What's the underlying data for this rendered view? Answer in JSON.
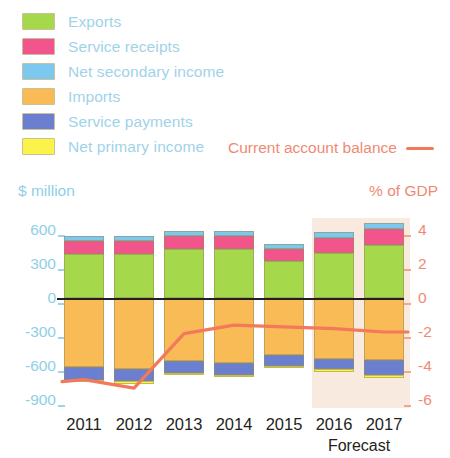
{
  "legend": {
    "items": [
      {
        "label": "Exports",
        "color": "#a5d94b",
        "key": "exports"
      },
      {
        "label": "Service receipts",
        "color": "#f2558c",
        "key": "service_receipts"
      },
      {
        "label": "Net secondary income",
        "color": "#7cc8ee",
        "key": "net_secondary_income"
      },
      {
        "label": "Imports",
        "color": "#f8b council",
        "key": "imports"
      },
      {
        "label": "Service payments",
        "color": "#6b7fd0",
        "key": "service_payments"
      },
      {
        "label": "Net primary income",
        "color": "#fbf24a",
        "key": "net_primary_income"
      }
    ],
    "line_series_label": "Current account balance",
    "line_color": "#f2795a"
  },
  "axes": {
    "left_title": "$ million",
    "right_title": "% of GDP",
    "left_ticks": [
      "600",
      "300",
      "0",
      "-300",
      "-600",
      "-900"
    ],
    "left_tick_values": [
      600,
      300,
      0,
      -300,
      -600,
      -900
    ],
    "right_ticks": [
      "4",
      "2",
      "0",
      "-2",
      "-4",
      "-6"
    ],
    "right_tick_values": [
      4,
      2,
      0,
      -2,
      -4,
      -6
    ],
    "left_color": "#8fcfe6",
    "right_color": "#f08a74"
  },
  "forecast": {
    "note": "Forecast",
    "years": [
      "2016",
      "2017"
    ],
    "band_color": "#f6ddcb"
  },
  "chart_data": {
    "type": "bar",
    "title": "",
    "subtitle": "",
    "xlabel": "",
    "ylabel": "$ million",
    "y2label": "% of GDP",
    "ylim": [
      -900,
      600
    ],
    "y2lim": [
      -6,
      4
    ],
    "grid": false,
    "legend_position": "top-left",
    "stacked": true,
    "categories": [
      "2011",
      "2012",
      "2013",
      "2014",
      "2015",
      "2016",
      "2017"
    ],
    "series": [
      {
        "name": "Exports",
        "color": "#a5d94b",
        "sign": "positive",
        "values": [
          390,
          390,
          430,
          430,
          330,
          400,
          470
        ]
      },
      {
        "name": "Service receipts",
        "color": "#f2558c",
        "sign": "positive",
        "values": [
          110,
          110,
          115,
          115,
          105,
          130,
          140
        ]
      },
      {
        "name": "Net secondary income",
        "color": "#7cc8ee",
        "sign": "positive",
        "values": [
          45,
          45,
          50,
          45,
          45,
          50,
          55
        ]
      },
      {
        "name": "Imports",
        "color": "#f5b köz",
        "sign": "negative",
        "values": [
          -610,
          -625,
          -555,
          -570,
          -500,
          -540,
          -545
        ]
      },
      {
        "name": "Service payments",
        "color": "#6b7fd0",
        "sign": "negative",
        "values": [
          -110,
          -110,
          -105,
          -110,
          -100,
          -90,
          -135
        ]
      },
      {
        "name": "Net primary income",
        "color": "#fbf24a",
        "sign": "negative",
        "values": [
          -20,
          -20,
          -20,
          -20,
          -20,
          -25,
          -25
        ]
      }
    ],
    "line_series": {
      "name": "Current account balance",
      "axis": "right",
      "unit": "% of GDP",
      "color": "#f2795a",
      "values": [
        -4.8,
        -5.3,
        -2.1,
        -1.6,
        -1.7,
        -1.8,
        -2.0
      ]
    }
  }
}
